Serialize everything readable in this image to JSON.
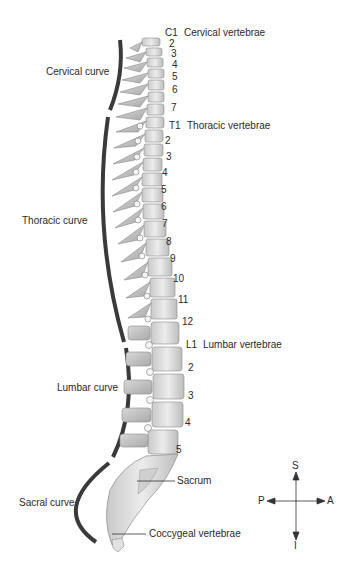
{
  "diagram": {
    "region_labels": {
      "cervical": "Cervical vertebrae",
      "thoracic": "Thoracic vertebrae",
      "lumbar": "Lumbar vertebrae",
      "sacrum": "Sacrum",
      "coccyx": "Coccygeal vertebrae"
    },
    "curve_labels": {
      "cervical": "Cervical curve",
      "thoracic": "Thoracic curve",
      "lumbar": "Lumbar curve",
      "sacral": "Sacral curve"
    },
    "cervical_numbers": [
      "C1",
      "2",
      "3",
      "4",
      "5",
      "6",
      "7"
    ],
    "thoracic_numbers": [
      "T1",
      "2",
      "3",
      "4",
      "5",
      "6",
      "7",
      "8",
      "9",
      "10",
      "11",
      "12"
    ],
    "lumbar_numbers": [
      "L1",
      "2",
      "3",
      "4",
      "5"
    ],
    "compass": {
      "superior": "S",
      "inferior": "I",
      "posterior": "P",
      "anterior": "A"
    },
    "colors": {
      "curve_line": "#3a3a3a",
      "bone_light": "#e8e8e8",
      "bone_shade": "#b5b5b5",
      "text": "#2a2a2a"
    }
  }
}
